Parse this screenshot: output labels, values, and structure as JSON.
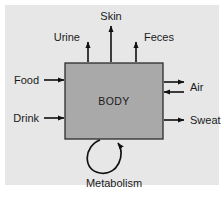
{
  "figure": {
    "panel_background": "#e7e7e7",
    "page_background": "#ffffff",
    "box_fill": "#a9a9a9",
    "box_stroke": "#2b2b2b",
    "arrow_color": "#111111",
    "text_color": "#1a1a1a"
  },
  "central_node": {
    "label": "BODY"
  },
  "inputs": [
    {
      "label": "Food",
      "direction": "into-body",
      "side": "left"
    },
    {
      "label": "Drink",
      "direction": "into-body",
      "side": "left"
    }
  ],
  "outputs_top": [
    {
      "label": "Urine",
      "direction": "out-of-body",
      "side": "top"
    },
    {
      "label": "Skin",
      "direction": "out-of-body",
      "side": "top"
    },
    {
      "label": "Feces",
      "direction": "out-of-body",
      "side": "top"
    }
  ],
  "exchanges_right": [
    {
      "label": "Air",
      "direction": "bidirectional",
      "side": "right"
    },
    {
      "label": "Sweat",
      "direction": "out-of-body",
      "side": "right"
    }
  ],
  "internal_process": {
    "label": "Metabolism",
    "direction": "self-loop-into-body",
    "side": "bottom"
  }
}
